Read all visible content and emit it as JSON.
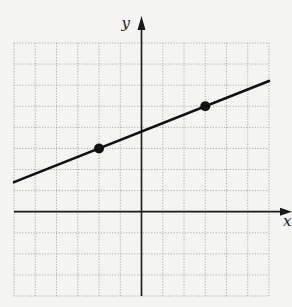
{
  "chart_data": {
    "type": "line",
    "title": "",
    "xlabel": "x",
    "ylabel": "y",
    "xlim": [
      -6,
      6
    ],
    "ylim": [
      -4,
      8
    ],
    "grid": true,
    "grid_step": 1,
    "tick_labels": false,
    "series": [
      {
        "name": "line",
        "equation": "y = 0.4x + 3.8",
        "slope": 0.4,
        "intercept": 3.8,
        "x": [
          -6,
          6
        ],
        "y": [
          1.4,
          6.2
        ]
      }
    ],
    "points": [
      {
        "x": -2,
        "y": 3
      },
      {
        "x": 3,
        "y": 5
      }
    ]
  },
  "colors": {
    "background": "#f4f4f2",
    "grid": "#9a9a9a",
    "axis": "#1a1a1a",
    "line": "#111111",
    "point": "#111111"
  }
}
